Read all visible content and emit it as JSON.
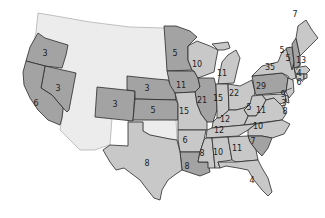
{
  "map": {
    "title": "",
    "colors": {
      "group_a": "#a3a3a3",
      "group_b": "#c8c8c8",
      "territory": "#ececec",
      "border": "#2a2a2a"
    },
    "states": [
      {
        "id": "OR",
        "label": "3",
        "group": "a"
      },
      {
        "id": "NV",
        "label": "3",
        "group": "a"
      },
      {
        "id": "CA",
        "label": "6",
        "group": "a"
      },
      {
        "id": "CO",
        "label": "3",
        "group": "a"
      },
      {
        "id": "NE",
        "label": "3",
        "group": "a"
      },
      {
        "id": "KS",
        "label": "5",
        "group": "a"
      },
      {
        "id": "MN",
        "label": "5",
        "group": "a"
      },
      {
        "id": "IA",
        "label": "11",
        "group": "a"
      },
      {
        "id": "WI",
        "label": "10",
        "group": "b"
      },
      {
        "id": "MI",
        "label": "11",
        "group": "b"
      },
      {
        "id": "IL",
        "label": "21",
        "group": "a"
      },
      {
        "id": "IN",
        "label": "15",
        "group": "b"
      },
      {
        "id": "OH",
        "label": "22",
        "group": "b"
      },
      {
        "id": "PA",
        "label": "29",
        "group": "a"
      },
      {
        "id": "NY",
        "label": "35",
        "group": "b"
      },
      {
        "id": "ME",
        "label": "7",
        "group": "b"
      },
      {
        "id": "NH",
        "label": "5",
        "group": "a"
      },
      {
        "id": "VT",
        "label": "5",
        "group": "a"
      },
      {
        "id": "MA",
        "label": "13",
        "group": "b"
      },
      {
        "id": "RI",
        "label": "4",
        "group": "b"
      },
      {
        "id": "CT",
        "label": "6",
        "group": "b"
      },
      {
        "id": "NJ",
        "label": "9",
        "group": "b"
      },
      {
        "id": "DE",
        "label": "3",
        "group": "b"
      },
      {
        "id": "MD",
        "label": "8",
        "group": "b"
      },
      {
        "id": "MO",
        "label": "15",
        "group": "b"
      },
      {
        "id": "KY",
        "label": "12",
        "group": "b"
      },
      {
        "id": "WV",
        "label": "5",
        "group": "b"
      },
      {
        "id": "VA",
        "label": "11",
        "group": "b"
      },
      {
        "id": "TN",
        "label": "12",
        "group": "b"
      },
      {
        "id": "NC",
        "label": "10",
        "group": "b"
      },
      {
        "id": "SC",
        "label": "7",
        "group": "a"
      },
      {
        "id": "AR",
        "label": "6",
        "group": "b"
      },
      {
        "id": "LA",
        "label": "8",
        "group": "a"
      },
      {
        "id": "MS",
        "label": "8",
        "group": "b"
      },
      {
        "id": "AL",
        "label": "10",
        "group": "b"
      },
      {
        "id": "GA",
        "label": "11",
        "group": "b"
      },
      {
        "id": "FL",
        "label": "4",
        "group": "b"
      },
      {
        "id": "TX",
        "label": "8",
        "group": "b"
      }
    ]
  }
}
